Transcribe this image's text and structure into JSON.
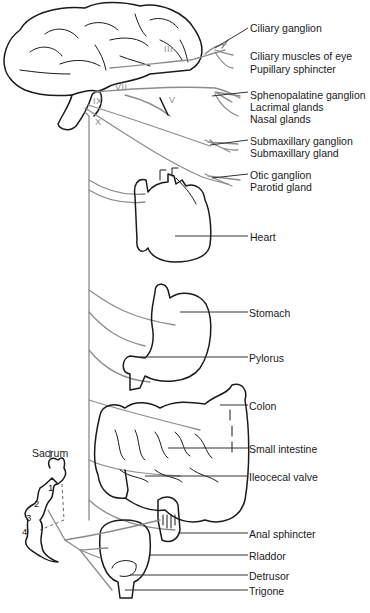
{
  "diagram": {
    "type": "anatomical-illustration",
    "cranial_nerves": [
      "III",
      "VII",
      "V",
      "IX",
      "X"
    ],
    "sacral_label": "Sacrum",
    "sacral_segments": [
      "1",
      "2",
      "3",
      "4"
    ],
    "labels": {
      "ciliary_ganglion": "Ciliary ganglion",
      "ciliary_muscles": "Ciliary muscles of eye",
      "pupillary_sphincter": "Pupillary sphincter",
      "sphenopalatine_ganglion": "Sphenopalatine ganglion",
      "lacrimal_glands": "Lacrimal glands",
      "nasal_glands": "Nasal glands",
      "submaxillary_ganglion": "Submaxillary ganglion",
      "submaxillary_gland": "Submaxillary gland",
      "otic_ganglion": "Otic ganglion",
      "parotid_gland": "Parotid gland",
      "heart": "Heart",
      "stomach": "Stomach",
      "pylorus": "Pylorus",
      "colon": "Colon",
      "small_intestine": "Small intestine",
      "ileocecal_valve": "Ileocecal valve",
      "anal_sphincter": "Anal sphincter",
      "bladder": "Rladdor",
      "detrusor": "Detrusor",
      "trigone": "Trigone"
    },
    "colors": {
      "ink": "#1a1a1a",
      "nerve": "#8c8c8c",
      "background": "#ffffff"
    }
  }
}
